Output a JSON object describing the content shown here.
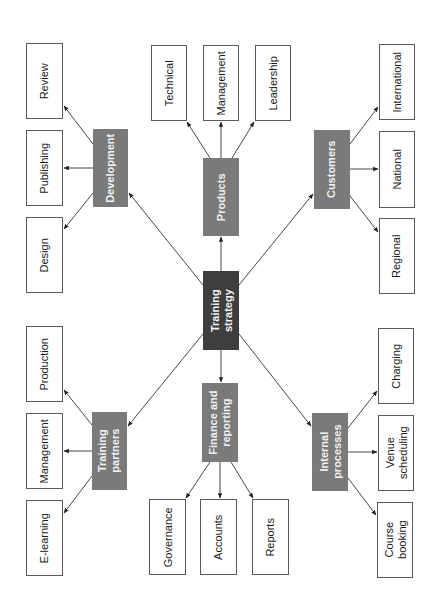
{
  "title": "Training strategy",
  "colors": {
    "core_fill": "#3e3e3e",
    "hub_fill": "#7a7a7a",
    "leaf_fill": "#ffffff",
    "leaf_border": "#5a5a5a",
    "edge": "#333333"
  },
  "center": {
    "id": "training-strategy",
    "label": "Training\nstrategy",
    "x": 203,
    "y": 271,
    "w": 36,
    "h": 79
  },
  "hubs": [
    {
      "id": "development",
      "label": "Development",
      "x": 93,
      "y": 129,
      "w": 35,
      "h": 78,
      "children": [
        {
          "id": "review",
          "label": "Review",
          "x": 26,
          "y": 43,
          "w": 37,
          "h": 76
        },
        {
          "id": "publishing",
          "label": "Publishing",
          "x": 26,
          "y": 130,
          "w": 37,
          "h": 76
        },
        {
          "id": "design",
          "label": "Design",
          "x": 26,
          "y": 217,
          "w": 37,
          "h": 76
        }
      ]
    },
    {
      "id": "products",
      "label": "Products",
      "x": 203,
      "y": 158,
      "w": 36,
      "h": 78,
      "children": [
        {
          "id": "technical",
          "label": "Technical",
          "x": 151,
          "y": 45,
          "w": 36,
          "h": 76
        },
        {
          "id": "management-products",
          "label": "Management",
          "x": 203,
          "y": 45,
          "w": 36,
          "h": 76
        },
        {
          "id": "leadership",
          "label": "Leadership",
          "x": 255,
          "y": 45,
          "w": 36,
          "h": 76
        }
      ]
    },
    {
      "id": "customers",
      "label": "Customers",
      "x": 314,
      "y": 130,
      "w": 36,
      "h": 79,
      "children": [
        {
          "id": "international",
          "label": "International",
          "x": 379,
          "y": 44,
          "w": 36,
          "h": 76
        },
        {
          "id": "national",
          "label": "National",
          "x": 379,
          "y": 131,
          "w": 36,
          "h": 77
        },
        {
          "id": "regional",
          "label": "Regional",
          "x": 379,
          "y": 218,
          "w": 36,
          "h": 76
        }
      ]
    },
    {
      "id": "training-partners",
      "label": "Training\npartners",
      "x": 92,
      "y": 412,
      "w": 35,
      "h": 78,
      "children": [
        {
          "id": "production",
          "label": "Production",
          "x": 26,
          "y": 326,
          "w": 37,
          "h": 76
        },
        {
          "id": "management-partners",
          "label": "Management",
          "x": 26,
          "y": 413,
          "w": 37,
          "h": 76
        },
        {
          "id": "e-learning",
          "label": "E-learning",
          "x": 26,
          "y": 500,
          "w": 37,
          "h": 76
        }
      ]
    },
    {
      "id": "finance-reporting",
      "label": "Finance and\nreporting",
      "x": 202,
      "y": 383,
      "w": 36,
      "h": 79,
      "children": [
        {
          "id": "governance",
          "label": "Governance",
          "x": 149,
          "y": 499,
          "w": 37,
          "h": 76
        },
        {
          "id": "accounts",
          "label": "Accounts",
          "x": 200,
          "y": 499,
          "w": 37,
          "h": 76
        },
        {
          "id": "reports",
          "label": "Reports",
          "x": 252,
          "y": 499,
          "w": 37,
          "h": 76
        }
      ]
    },
    {
      "id": "internal-processes",
      "label": "Internal\nprocesses",
      "x": 312,
      "y": 413,
      "w": 36,
      "h": 78,
      "children": [
        {
          "id": "charging",
          "label": "Charging",
          "x": 378,
          "y": 328,
          "w": 36,
          "h": 76
        },
        {
          "id": "venue-scheduling",
          "label": "Venue\nscheduling",
          "x": 378,
          "y": 415,
          "w": 36,
          "h": 76
        },
        {
          "id": "course-booking",
          "label": "Course\nbooking",
          "x": 377,
          "y": 502,
          "w": 36,
          "h": 76
        }
      ]
    }
  ],
  "edges": [
    {
      "from": "training-strategy",
      "to": "development",
      "x1": 203,
      "y1": 285,
      "x2": 129,
      "y2": 193
    },
    {
      "from": "training-strategy",
      "to": "products",
      "x1": 221,
      "y1": 271,
      "x2": 221,
      "y2": 237
    },
    {
      "from": "training-strategy",
      "to": "customers",
      "x1": 239,
      "y1": 285,
      "x2": 313,
      "y2": 194
    },
    {
      "from": "training-strategy",
      "to": "training-partners",
      "x1": 203,
      "y1": 334,
      "x2": 128,
      "y2": 426
    },
    {
      "from": "training-strategy",
      "to": "finance-reporting",
      "x1": 221,
      "y1": 350,
      "x2": 221,
      "y2": 382
    },
    {
      "from": "training-strategy",
      "to": "internal-processes",
      "x1": 239,
      "y1": 334,
      "x2": 311,
      "y2": 426
    },
    {
      "from": "development",
      "to": "review",
      "x1": 93,
      "y1": 144,
      "x2": 64,
      "y2": 106
    },
    {
      "from": "development",
      "to": "publishing",
      "x1": 93,
      "y1": 168,
      "x2": 64,
      "y2": 168
    },
    {
      "from": "development",
      "to": "design",
      "x1": 93,
      "y1": 193,
      "x2": 64,
      "y2": 229
    },
    {
      "from": "products",
      "to": "technical",
      "x1": 210,
      "y1": 158,
      "x2": 187,
      "y2": 122
    },
    {
      "from": "products",
      "to": "management-products",
      "x1": 221,
      "y1": 158,
      "x2": 221,
      "y2": 122
    },
    {
      "from": "products",
      "to": "leadership",
      "x1": 232,
      "y1": 158,
      "x2": 254,
      "y2": 122
    },
    {
      "from": "customers",
      "to": "international",
      "x1": 350,
      "y1": 144,
      "x2": 378,
      "y2": 107
    },
    {
      "from": "customers",
      "to": "national",
      "x1": 350,
      "y1": 169,
      "x2": 378,
      "y2": 169
    },
    {
      "from": "customers",
      "to": "regional",
      "x1": 350,
      "y1": 196,
      "x2": 378,
      "y2": 232
    },
    {
      "from": "training-partners",
      "to": "production",
      "x1": 92,
      "y1": 425,
      "x2": 64,
      "y2": 390
    },
    {
      "from": "training-partners",
      "to": "management-partners",
      "x1": 92,
      "y1": 451,
      "x2": 64,
      "y2": 451
    },
    {
      "from": "training-partners",
      "to": "e-learning",
      "x1": 92,
      "y1": 476,
      "x2": 64,
      "y2": 513
    },
    {
      "from": "finance-reporting",
      "to": "governance",
      "x1": 210,
      "y1": 462,
      "x2": 186,
      "y2": 498
    },
    {
      "from": "finance-reporting",
      "to": "accounts",
      "x1": 220,
      "y1": 462,
      "x2": 220,
      "y2": 498
    },
    {
      "from": "finance-reporting",
      "to": "reports",
      "x1": 231,
      "y1": 462,
      "x2": 253,
      "y2": 498
    },
    {
      "from": "internal-processes",
      "to": "charging",
      "x1": 348,
      "y1": 428,
      "x2": 377,
      "y2": 391
    },
    {
      "from": "internal-processes",
      "to": "venue-scheduling",
      "x1": 348,
      "y1": 452,
      "x2": 377,
      "y2": 452
    },
    {
      "from": "internal-processes",
      "to": "course-booking",
      "x1": 348,
      "y1": 478,
      "x2": 376,
      "y2": 515
    }
  ]
}
